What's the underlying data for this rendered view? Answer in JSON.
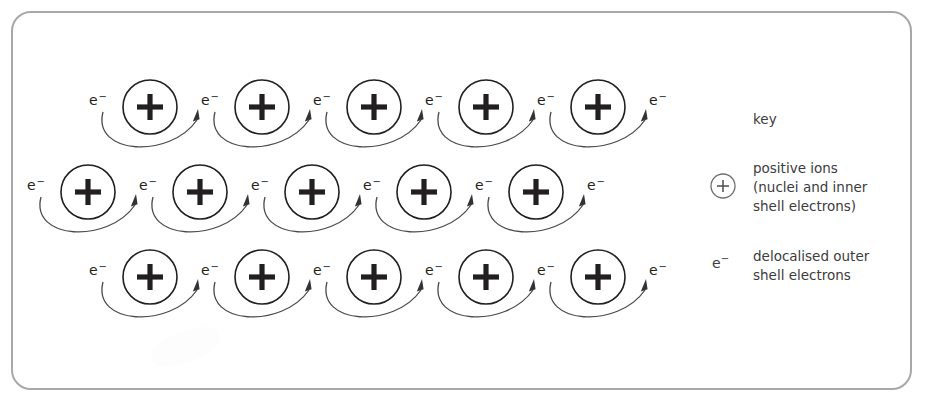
{
  "figure": {
    "frame": {
      "border_color": "#a8a8a8",
      "background": "#ffffff"
    }
  },
  "lattice": {
    "ion_symbol": "+",
    "electron_label": "e",
    "electron_charge": "−",
    "rows": [
      {
        "row_index": 1,
        "ion_count": 5,
        "electron_count": 6,
        "center_y": 107,
        "first_ion_x": 150,
        "spacing": 112
      },
      {
        "row_index": 2,
        "ion_count": 5,
        "electron_count": 6,
        "center_y": 192,
        "first_ion_x": 88,
        "spacing": 112
      },
      {
        "row_index": 3,
        "ion_count": 5,
        "electron_count": 6,
        "center_y": 277,
        "first_ion_x": 150,
        "spacing": 112
      }
    ],
    "ion_radius": 27,
    "arrow_color": "#4a4a4a",
    "ion_color": "#231f20"
  },
  "key": {
    "title": "key",
    "ion_entry": {
      "glyph": "+",
      "text": "positive ions\n(nuclei and inner\nshell electrons)"
    },
    "electron_entry": {
      "glyph": "e",
      "glyph_charge": "−",
      "text": "delocalised outer\nshell electrons"
    }
  }
}
